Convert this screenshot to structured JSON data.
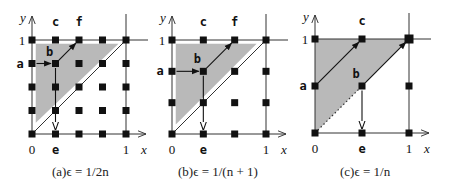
{
  "figure": {
    "panels": [
      {
        "id": "a",
        "caption": "(a)ϵ = 1/2n",
        "origin": [
          32,
          134
        ],
        "unit": 94,
        "grid_n": 4,
        "axis_labels": {
          "x": "x",
          "y": "y",
          "zero": "0",
          "one_x": "1",
          "one_y": "1"
        },
        "points": [
          {
            "label": "a",
            "x": 0,
            "y": 0.75
          },
          {
            "label": "b",
            "x": 0.25,
            "y": 0.75
          },
          {
            "label": "c",
            "x": 0.25,
            "y": 1
          },
          {
            "label": "e",
            "x": 0.25,
            "y": 0
          },
          {
            "label": "f",
            "x": 0.5,
            "y": 1
          }
        ],
        "shaded_triangle": [
          [
            0.04,
            0.96
          ],
          [
            0.92,
            0.96
          ],
          [
            0.04,
            0.12
          ]
        ],
        "diagonal": {
          "from": [
            0,
            0
          ],
          "to": [
            1,
            1
          ],
          "style": "solid"
        },
        "extra_lines": [],
        "arrows": [
          {
            "from": "a",
            "to": "b",
            "head": "filled"
          },
          {
            "from": "b",
            "to": "f",
            "head": "filled"
          },
          {
            "from": "b",
            "to": "e",
            "head": "open"
          }
        ]
      },
      {
        "id": "b",
        "caption": "(b)ϵ = 1/(n + 1)",
        "origin": [
          172,
          134
        ],
        "unit": 94,
        "grid_n": 3,
        "axis_labels": {
          "x": "x",
          "y": "y",
          "zero": "0",
          "one_x": "1",
          "one_y": "1"
        },
        "points": [
          {
            "label": "a",
            "x": 0,
            "y": 0.6667
          },
          {
            "label": "b",
            "x": 0.3333,
            "y": 0.6667
          },
          {
            "label": "c",
            "x": 0.3333,
            "y": 1
          },
          {
            "label": "e",
            "x": 0.3333,
            "y": 0
          },
          {
            "label": "f",
            "x": 0.6667,
            "y": 1
          }
        ],
        "shaded_triangle": [
          [
            0.04,
            0.96
          ],
          [
            0.9,
            0.96
          ],
          [
            0.04,
            0.1
          ]
        ],
        "diagonal": {
          "from": [
            0,
            0
          ],
          "to": [
            1,
            1
          ],
          "style": "solid"
        },
        "extra_lines": [],
        "arrows": [
          {
            "from": "a",
            "to": "b",
            "head": "filled"
          },
          {
            "from": "b",
            "to": "f",
            "head": "filled"
          },
          {
            "from": "b",
            "to": "e",
            "head": "open"
          }
        ]
      },
      {
        "id": "c",
        "caption": "(c)ϵ = 1/n",
        "origin": [
          315,
          133
        ],
        "unit": 94,
        "grid_n": 2,
        "axis_labels": {
          "x": "x",
          "y": "y",
          "zero": "0",
          "one_x": "1",
          "one_y": "1"
        },
        "points": [
          {
            "label": "a",
            "x": 0,
            "y": 0.5
          },
          {
            "label": "b",
            "x": 0.5,
            "y": 0.5
          },
          {
            "label": "c",
            "x": 0.5,
            "y": 1
          },
          {
            "label": "e",
            "x": 0.5,
            "y": 0
          }
        ],
        "shaded_triangle": [
          [
            0,
            1
          ],
          [
            1,
            1
          ],
          [
            0,
            0
          ]
        ],
        "diagonal": null,
        "extra_lines": [
          {
            "from": [
              0,
              0
            ],
            "to": [
              0.5,
              0.5
            ],
            "style": "dotted"
          }
        ],
        "arrows": [
          {
            "from": "a",
            "to": "c",
            "head": "filled"
          },
          {
            "from": "b",
            "to": "corner11",
            "head": "filled"
          },
          {
            "from": "b",
            "to": "e",
            "head": "open"
          }
        ]
      }
    ],
    "colors": {
      "shade": "#b9b9b9",
      "ink": "#111111",
      "line": "#333333",
      "background": "#ffffff"
    }
  }
}
